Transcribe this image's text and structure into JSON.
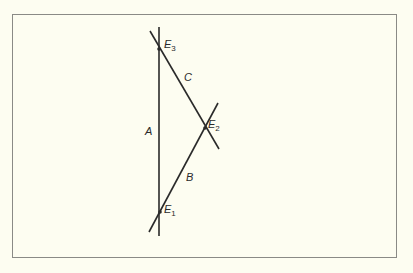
{
  "diagram": {
    "colors": {
      "background": "#fdfdf1",
      "frame": "#8a8a86",
      "line": "#2a2a2a"
    },
    "lines": [
      {
        "id": "A",
        "label": "A",
        "x1": 159,
        "y1": 27,
        "x2": 159,
        "y2": 236
      },
      {
        "id": "B",
        "label": "B",
        "x1": 149,
        "y1": 232,
        "x2": 218,
        "y2": 103
      },
      {
        "id": "C",
        "label": "C",
        "x1": 150,
        "y1": 31,
        "x2": 219,
        "y2": 149
      }
    ],
    "points": [
      {
        "id": "E1",
        "name": "E",
        "sub": "1",
        "x": 160,
        "y": 212
      },
      {
        "id": "E2",
        "name": "E",
        "sub": "2",
        "x": 205,
        "y": 128
      },
      {
        "id": "E3",
        "name": "E",
        "sub": "3",
        "x": 159,
        "y": 49
      }
    ]
  }
}
